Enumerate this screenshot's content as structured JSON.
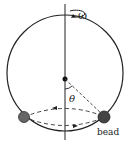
{
  "diagram": {
    "labels": {
      "omega": "ω",
      "theta": "θ",
      "bead": "bead"
    },
    "colors": {
      "stroke": "#222222",
      "bead_fill": "#555555",
      "background": "#ffffff"
    }
  }
}
